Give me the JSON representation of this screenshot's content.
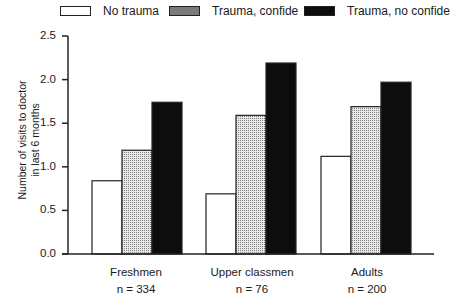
{
  "legend": [
    {
      "label": "No trauma",
      "fill": "white"
    },
    {
      "label": "Trauma, confide",
      "fill": "dotted"
    },
    {
      "label": "Trauma, no confide",
      "fill": "black"
    }
  ],
  "y_axis": {
    "label_line1": "Number of visits to doctor",
    "label_line2": "in last 6 months",
    "ticks": [
      "0.0",
      "0.5",
      "1.0",
      "1.5",
      "2.0",
      "2.5"
    ]
  },
  "groups": [
    {
      "name": "Freshmen",
      "n_label": "n = 334"
    },
    {
      "name": "Upper classmen",
      "n_label": "n = 76"
    },
    {
      "name": "Adults",
      "n_label": "n = 200"
    }
  ],
  "chart_data": {
    "type": "bar",
    "title": "",
    "xlabel": "",
    "ylabel": "Number of visits to doctor in last 6 months",
    "categories": [
      "Freshmen (n = 334)",
      "Upper classmen (n = 76)",
      "Adults (n = 200)"
    ],
    "series": [
      {
        "name": "No trauma",
        "values": [
          0.84,
          0.69,
          1.12
        ]
      },
      {
        "name": "Trauma, confide",
        "values": [
          1.19,
          1.59,
          1.69
        ]
      },
      {
        "name": "Trauma, no confide",
        "values": [
          1.74,
          2.19,
          1.97
        ]
      }
    ],
    "ylim": [
      0,
      2.5
    ],
    "yticks": [
      0.0,
      0.5,
      1.0,
      1.5,
      2.0,
      2.5
    ],
    "grid": false,
    "legend_position": "top"
  },
  "colors": {
    "no_trauma": "#ffffff",
    "confide": "#d0d0d0",
    "no_confide": "#0d0d0d",
    "stroke": "#222222"
  }
}
